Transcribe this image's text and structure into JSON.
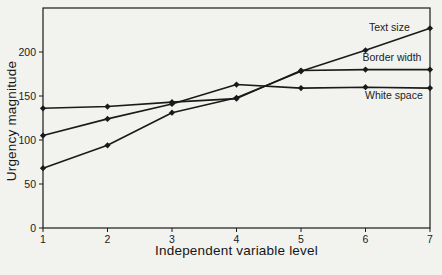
{
  "page": {
    "background_color": "#f2f2ef",
    "ink_color": "#1a1a1a"
  },
  "chart_data": {
    "type": "line",
    "title": "",
    "xlabel": "Independent variable level",
    "ylabel": "Urgency magnitude",
    "x": [
      1,
      2,
      3,
      4,
      5,
      6,
      7
    ],
    "xlim": [
      1,
      7
    ],
    "ylim": [
      0,
      250
    ],
    "yticks": [
      0,
      50,
      100,
      150,
      200
    ],
    "grid": false,
    "frame": "full-box",
    "marker": "diamond",
    "legend_position": "inline-right-annotations",
    "series": [
      {
        "name": "Text size",
        "values": [
          68,
          94,
          131,
          148,
          178,
          202,
          227
        ],
        "label_at": {
          "x": 6.37,
          "y": 228
        }
      },
      {
        "name": "Border width",
        "values": [
          136,
          138,
          143,
          147,
          179,
          180,
          180
        ],
        "label_at": {
          "x": 6.41,
          "y": 194
        }
      },
      {
        "name": "White space",
        "values": [
          105,
          124,
          141,
          163,
          159,
          160,
          159
        ],
        "label_at": {
          "x": 6.44,
          "y": 151
        }
      }
    ]
  }
}
